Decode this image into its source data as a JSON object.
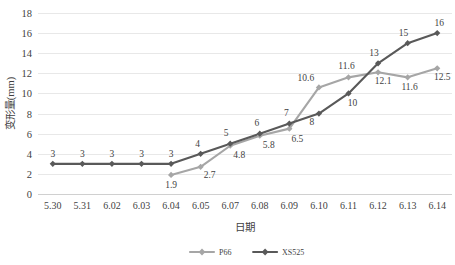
{
  "chart_data": {
    "type": "line",
    "title": "",
    "xlabel": "日期",
    "ylabel": "变形量(mm)",
    "ylim": [
      0,
      18
    ],
    "ytick_step": 2,
    "grid": true,
    "legend_position": "bottom",
    "categories": [
      "5.30",
      "5.31",
      "6.02",
      "6.03",
      "6.04",
      "6.05",
      "6.07",
      "6.08",
      "6.09",
      "6.10",
      "6.11",
      "6.12",
      "6.13",
      "6.14"
    ],
    "yticks": [
      "0",
      "2",
      "4",
      "6",
      "8",
      "10",
      "12",
      "14",
      "16",
      "18"
    ],
    "series": [
      {
        "name": "P66",
        "color": "#a6a6a6",
        "values": [
          null,
          null,
          null,
          null,
          1.9,
          2.7,
          4.8,
          5.8,
          6.5,
          10.6,
          11.6,
          12.1,
          11.6,
          12.5
        ],
        "labels": [
          "",
          "",
          "",
          "",
          "1.9",
          "2.7",
          "4.8",
          "5.8",
          "6.5",
          "10.6",
          "11.6",
          "12.1",
          "11.6",
          "12.5"
        ]
      },
      {
        "name": "XS525",
        "color": "#595959",
        "values": [
          3,
          3,
          3,
          3,
          3,
          4,
          5,
          6,
          7,
          8,
          10,
          13,
          15,
          16
        ],
        "labels": [
          "3",
          "3",
          "3",
          "3",
          "3",
          "4",
          "5",
          "6",
          "7",
          "8",
          "10",
          "13",
          "15",
          "16"
        ]
      }
    ]
  },
  "legend": {
    "items": [
      {
        "label": "P66",
        "color": "#a6a6a6"
      },
      {
        "label": "XS525",
        "color": "#595959"
      }
    ]
  }
}
